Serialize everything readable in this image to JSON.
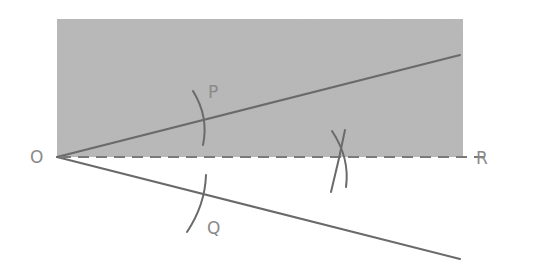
{
  "diagram": {
    "colors": {
      "background": "#ffffff",
      "shaded_region": "#b8b8b8",
      "line": "#6a6a6a",
      "label": "#8a8a8a"
    },
    "points": {
      "O": {
        "label": "O",
        "x": 57,
        "y": 157
      },
      "P": {
        "label": "P",
        "x": 211,
        "y": 117
      },
      "Q": {
        "label": "Q",
        "x": 201,
        "y": 198
      },
      "R": {
        "label": "R",
        "x": 497,
        "y": 157
      }
    },
    "labels": {
      "O": "O",
      "P": "P",
      "Q": "Q",
      "R": "R"
    },
    "shaded_region": {
      "x": 57,
      "y": 19,
      "width": 406,
      "height": 138
    },
    "rays": [
      {
        "name": "upper-ray",
        "from": "O",
        "to": [
          460,
          55
        ]
      },
      {
        "name": "lower-ray",
        "from": "O",
        "to": [
          460,
          259
        ]
      }
    ],
    "bisector": {
      "name": "bisector-OR",
      "from": "O",
      "to": [
        488,
        157
      ],
      "style": "dashed"
    },
    "arcs": [
      {
        "name": "arc-at-P"
      },
      {
        "name": "arc-at-Q"
      },
      {
        "name": "intersect-arc-1"
      },
      {
        "name": "intersect-arc-2"
      }
    ]
  }
}
